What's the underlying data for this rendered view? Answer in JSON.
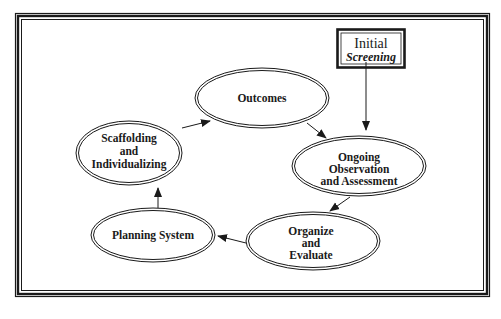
{
  "diagram": {
    "colors": {
      "stroke": "#1a1a1a",
      "background": "#ffffff",
      "caption": "#c8c8c8"
    },
    "start_box": {
      "title": "Initial",
      "subtitle": "Screening"
    },
    "nodes": [
      {
        "id": "outcomes",
        "lines": [
          "Outcomes"
        ]
      },
      {
        "id": "ongoing",
        "lines": [
          "Ongoing",
          "Observation",
          "and Assessment"
        ]
      },
      {
        "id": "organize",
        "lines": [
          "Organize",
          "and",
          "Evaluate"
        ]
      },
      {
        "id": "planning",
        "lines": [
          "Planning System"
        ]
      },
      {
        "id": "scaffolding",
        "lines": [
          "Scaffolding",
          "and",
          "Individualizing"
        ]
      }
    ],
    "edges": [
      {
        "from": "Initial Screening",
        "to": "Ongoing Observation and Assessment"
      },
      {
        "from": "Outcomes",
        "to": "Ongoing Observation and Assessment"
      },
      {
        "from": "Ongoing Observation and Assessment",
        "to": "Organize and Evaluate"
      },
      {
        "from": "Organize and Evaluate",
        "to": "Planning System"
      },
      {
        "from": "Planning System",
        "to": "Scaffolding and Individualizing"
      },
      {
        "from": "Scaffolding and Individualizing",
        "to": "Outcomes"
      }
    ]
  }
}
